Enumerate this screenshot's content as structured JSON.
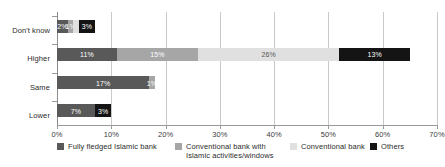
{
  "chart_data": {
    "type": "bar",
    "orientation": "horizontal",
    "stacked": true,
    "title": "",
    "xlabel": "",
    "ylabel": "",
    "xlim": [
      0,
      70
    ],
    "xticks": [
      "0%",
      "10%",
      "20%",
      "30%",
      "40%",
      "50%",
      "60%",
      "70%"
    ],
    "xtick_values": [
      0,
      10,
      20,
      30,
      40,
      50,
      60,
      70
    ],
    "grid": true,
    "legend_position": "bottom",
    "categories": [
      "Don't know",
      "Higher",
      "Same",
      "Lower"
    ],
    "series": [
      {
        "name": "Fully fledged Islamic bank",
        "color": "#595959",
        "values": [
          2,
          11,
          17,
          7
        ],
        "labels": [
          "2%",
          "11%",
          "17%",
          "7%"
        ]
      },
      {
        "name": "Conventional bank with\nIslamic activities/windows",
        "color": "#a6a6a6",
        "values": [
          1,
          15,
          1,
          0
        ],
        "labels": [
          "1%",
          "15%",
          "1%",
          ""
        ]
      },
      {
        "name": "Conventional bank",
        "color": "#e0e0e0",
        "values": [
          1,
          26,
          0,
          0
        ],
        "labels": [
          "",
          "26%",
          "",
          ""
        ]
      },
      {
        "name": "Others",
        "color": "#141414",
        "values": [
          3,
          13,
          0,
          3
        ],
        "labels": [
          "3%",
          "13%",
          "",
          "3%"
        ]
      }
    ]
  },
  "legend": {
    "items": [
      {
        "label": "Fully fledged Islamic bank",
        "color": "#595959"
      },
      {
        "label": "Conventional bank with\nIslamic activities/windows",
        "color": "#a6a6a6"
      },
      {
        "label": "Conventional bank",
        "color": "#e0e0e0"
      },
      {
        "label": "Others",
        "color": "#141414"
      }
    ]
  }
}
